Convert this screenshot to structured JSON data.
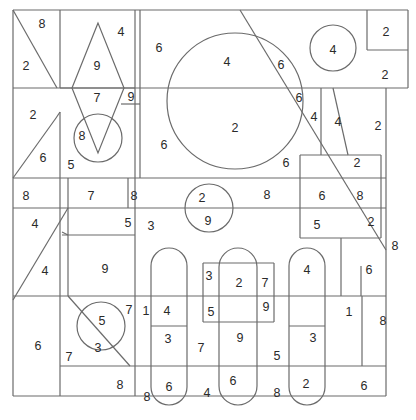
{
  "diagram": {
    "type": "number-region-puzzle",
    "stroke_color": "#6b6b6b",
    "text_color": "#2a2a2a",
    "background": "#ffffff"
  },
  "lines": [
    [
      13,
      10,
      408,
      10
    ],
    [
      13,
      10,
      13,
      396
    ],
    [
      13,
      396,
      386,
      396
    ],
    [
      408,
      10,
      408,
      88
    ],
    [
      386,
      88,
      386,
      396
    ],
    [
      60,
      10,
      60,
      88
    ],
    [
      135,
      10,
      135,
      396
    ],
    [
      140,
      10,
      140,
      178
    ],
    [
      13,
      88,
      408,
      88
    ],
    [
      367,
      10,
      367,
      50
    ],
    [
      367,
      50,
      408,
      50
    ],
    [
      13,
      10,
      57,
      88
    ],
    [
      56,
      118,
      60,
      112
    ],
    [
      60,
      112,
      60,
      178
    ],
    [
      13,
      178,
      56,
      118
    ],
    [
      60,
      88,
      135,
      88
    ],
    [
      121,
      104,
      140,
      104
    ],
    [
      13,
      178,
      386,
      178
    ],
    [
      13,
      208,
      140,
      208
    ],
    [
      60,
      178,
      60,
      396
    ],
    [
      128,
      178,
      128,
      208
    ],
    [
      68,
      178,
      68,
      235
    ],
    [
      62,
      235,
      135,
      235
    ],
    [
      62,
      232,
      68,
      235
    ],
    [
      13,
      300,
      68,
      208
    ],
    [
      13,
      296,
      386,
      296
    ],
    [
      68,
      235,
      68,
      296
    ],
    [
      361,
      266,
      361,
      296
    ],
    [
      60,
      366,
      135,
      366
    ],
    [
      135,
      366,
      386,
      366
    ],
    [
      321,
      88,
      321,
      155
    ],
    [
      333,
      88,
      348,
      155
    ],
    [
      300,
      155,
      381,
      155
    ],
    [
      300,
      155,
      300,
      238
    ],
    [
      381,
      155,
      381,
      238
    ],
    [
      300,
      238,
      381,
      238
    ],
    [
      140,
      208,
      386,
      208
    ],
    [
      240,
      10,
      386,
      250
    ],
    [
      68,
      296,
      130,
      366
    ],
    [
      341,
      238,
      341,
      296
    ],
    [
      203,
      263,
      274,
      263
    ],
    [
      203,
      263,
      203,
      322
    ],
    [
      274,
      263,
      274,
      322
    ],
    [
      203,
      322,
      274,
      322
    ],
    [
      362,
      296,
      362,
      366
    ],
    [
      151,
      326,
      187,
      326
    ],
    [
      289,
      326,
      325,
      326
    ]
  ],
  "diamond": {
    "points": "98,23 72,88 98,153 124,88"
  },
  "circles": [
    {
      "cx": 235,
      "cy": 101,
      "r": 68
    },
    {
      "cx": 333,
      "cy": 48,
      "r": 23
    },
    {
      "cx": 98,
      "cy": 138,
      "r": 24
    },
    {
      "cx": 209,
      "cy": 208,
      "r": 24
    },
    {
      "cx": 101,
      "cy": 326,
      "r": 24
    }
  ],
  "capsules": [
    {
      "x": 151,
      "y": 248,
      "w": 36,
      "h": 157
    },
    {
      "x": 219,
      "y": 248,
      "w": 38,
      "h": 157
    },
    {
      "x": 289,
      "y": 248,
      "w": 36,
      "h": 157
    }
  ],
  "numbers": [
    {
      "v": "8",
      "x": 42,
      "y": 24
    },
    {
      "v": "2",
      "x": 26,
      "y": 66
    },
    {
      "v": "4",
      "x": 121,
      "y": 32
    },
    {
      "v": "9",
      "x": 97,
      "y": 66
    },
    {
      "v": "6",
      "x": 159,
      "y": 48
    },
    {
      "v": "4",
      "x": 227,
      "y": 62
    },
    {
      "v": "6",
      "x": 281,
      "y": 65
    },
    {
      "v": "4",
      "x": 333,
      "y": 50
    },
    {
      "v": "2",
      "x": 386,
      "y": 32
    },
    {
      "v": "2",
      "x": 385,
      "y": 75
    },
    {
      "v": "7",
      "x": 97,
      "y": 98
    },
    {
      "v": "9",
      "x": 131,
      "y": 97
    },
    {
      "v": "2",
      "x": 33,
      "y": 115
    },
    {
      "v": "8",
      "x": 82,
      "y": 136
    },
    {
      "v": "6",
      "x": 43,
      "y": 158
    },
    {
      "v": "5",
      "x": 71,
      "y": 165
    },
    {
      "v": "6",
      "x": 164,
      "y": 145
    },
    {
      "v": "2",
      "x": 235,
      "y": 128
    },
    {
      "v": "6",
      "x": 299,
      "y": 98
    },
    {
      "v": "4",
      "x": 314,
      "y": 117
    },
    {
      "v": "4",
      "x": 338,
      "y": 122
    },
    {
      "v": "2",
      "x": 378,
      "y": 126
    },
    {
      "v": "6",
      "x": 286,
      "y": 163
    },
    {
      "v": "2",
      "x": 357,
      "y": 163
    },
    {
      "v": "8",
      "x": 26,
      "y": 196
    },
    {
      "v": "7",
      "x": 91,
      "y": 196
    },
    {
      "v": "8",
      "x": 134,
      "y": 196
    },
    {
      "v": "2",
      "x": 202,
      "y": 198
    },
    {
      "v": "8",
      "x": 267,
      "y": 195
    },
    {
      "v": "6",
      "x": 322,
      "y": 196
    },
    {
      "v": "8",
      "x": 360,
      "y": 196
    },
    {
      "v": "4",
      "x": 35,
      "y": 224
    },
    {
      "v": "5",
      "x": 128,
      "y": 223
    },
    {
      "v": "3",
      "x": 151,
      "y": 226
    },
    {
      "v": "9",
      "x": 208,
      "y": 221
    },
    {
      "v": "5",
      "x": 317,
      "y": 225
    },
    {
      "v": "2",
      "x": 371,
      "y": 222
    },
    {
      "v": "8",
      "x": 395,
      "y": 246
    },
    {
      "v": "4",
      "x": 45,
      "y": 271
    },
    {
      "v": "9",
      "x": 105,
      "y": 269
    },
    {
      "v": "3",
      "x": 209,
      "y": 276
    },
    {
      "v": "2",
      "x": 239,
      "y": 283
    },
    {
      "v": "7",
      "x": 265,
      "y": 283
    },
    {
      "v": "4",
      "x": 307,
      "y": 270
    },
    {
      "v": "6",
      "x": 369,
      "y": 270
    },
    {
      "v": "7",
      "x": 129,
      "y": 310
    },
    {
      "v": "1",
      "x": 146,
      "y": 311
    },
    {
      "v": "4",
      "x": 167,
      "y": 311
    },
    {
      "v": "5",
      "x": 211,
      "y": 312
    },
    {
      "v": "9",
      "x": 266,
      "y": 307
    },
    {
      "v": "1",
      "x": 349,
      "y": 312
    },
    {
      "v": "8",
      "x": 383,
      "y": 321
    },
    {
      "v": "5",
      "x": 102,
      "y": 321
    },
    {
      "v": "6",
      "x": 38,
      "y": 346
    },
    {
      "v": "3",
      "x": 98,
      "y": 348
    },
    {
      "v": "3",
      "x": 168,
      "y": 339
    },
    {
      "v": "9",
      "x": 240,
      "y": 338
    },
    {
      "v": "3",
      "x": 313,
      "y": 338
    },
    {
      "v": "7",
      "x": 201,
      "y": 348
    },
    {
      "v": "7",
      "x": 69,
      "y": 357
    },
    {
      "v": "5",
      "x": 277,
      "y": 356
    },
    {
      "v": "8",
      "x": 120,
      "y": 385
    },
    {
      "v": "6",
      "x": 169,
      "y": 387
    },
    {
      "v": "4",
      "x": 207,
      "y": 393
    },
    {
      "v": "6",
      "x": 233,
      "y": 381
    },
    {
      "v": "8",
      "x": 277,
      "y": 393
    },
    {
      "v": "2",
      "x": 306,
      "y": 384
    },
    {
      "v": "6",
      "x": 364,
      "y": 386
    },
    {
      "v": "8",
      "x": 147,
      "y": 397
    }
  ]
}
